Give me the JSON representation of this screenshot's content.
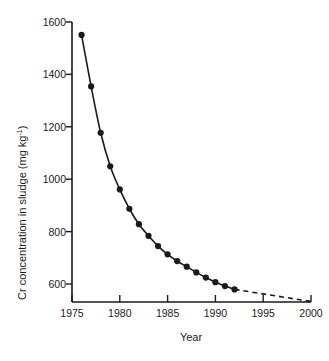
{
  "chart_data": {
    "type": "line",
    "title": "",
    "subtitle": "",
    "xlabel": "Year",
    "ylabel": "Cr concentration in sludge (mg kg",
    "ylabel_superscript": "-1",
    "ylabel_suffix": ")",
    "ylabel_full": "Cr concentration in sludge (mg kg-1)",
    "xlim": [
      1975,
      2000
    ],
    "ylim": [
      513,
      1600
    ],
    "xticks": [
      1975,
      1980,
      1985,
      1990,
      1995,
      2000
    ],
    "xtick_labels": [
      "1975",
      "1980",
      "1985",
      "1990",
      "1995",
      "2000"
    ],
    "yticks": [
      600,
      800,
      1000,
      1200,
      1400,
      1600
    ],
    "ytick_labels": [
      "600",
      "800",
      "1000",
      "1200",
      "1400",
      "1600"
    ],
    "grid": false,
    "legend": null,
    "legend_position": "none",
    "marker": "filled-circle",
    "line_color": "#1a1a1a",
    "series": [
      {
        "name": "Measured",
        "style": "solid",
        "markers": true,
        "x": [
          1976,
          1977,
          1978,
          1979,
          1980,
          1981,
          1982,
          1983,
          1984,
          1985,
          1986,
          1987,
          1988,
          1989,
          1990,
          1991,
          1992
        ],
        "values": [
          1550,
          1350,
          1170,
          1040,
          950,
          875,
          815,
          770,
          730,
          698,
          672,
          650,
          628,
          608,
          590,
          575,
          562
        ]
      },
      {
        "name": "Extrapolated",
        "style": "dashed",
        "markers": false,
        "x": [
          1992,
          2000
        ],
        "values": [
          562,
          515
        ]
      }
    ]
  },
  "figure": {
    "background_color": "#ffffff",
    "foreground_color": "#1a1a1a"
  }
}
